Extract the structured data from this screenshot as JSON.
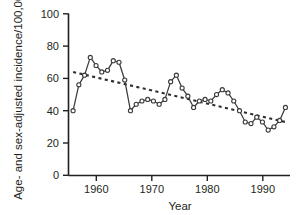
{
  "chart_data": {
    "type": "line",
    "title": "",
    "xlabel": "Year",
    "ylabel": "Age- and sex-adjusted incidence/100,000",
    "xlim": [
      1955.2,
      1993.8
    ],
    "ylim": [
      0,
      100
    ],
    "xticks": [
      1960,
      1970,
      1980,
      1990
    ],
    "xtick_labels": [
      "1960",
      "1970",
      "1980",
      "1990"
    ],
    "yticks": [
      0,
      20,
      40,
      60,
      80,
      100
    ],
    "ytick_labels": [
      "0",
      "20",
      "40",
      "60",
      "80",
      "100"
    ],
    "grid": false,
    "legend": "none",
    "series": [
      {
        "name": "Age- and sex-adjusted incidence",
        "style": "solid-line-with-open-circle-markers",
        "marker": "open-circle",
        "color": "#3b3b3b",
        "x": [
          1956,
          1957,
          1958,
          1959,
          1960,
          1961,
          1962,
          1963,
          1964,
          1965,
          1966,
          1967,
          1968,
          1969,
          1970,
          1971,
          1972,
          1973,
          1974,
          1975,
          1976,
          1977,
          1978,
          1979,
          1980,
          1981,
          1982,
          1983,
          1984,
          1985,
          1986,
          1987,
          1988,
          1989,
          1990,
          1991,
          1992,
          1993
        ],
        "values": [
          40,
          56,
          62,
          73,
          68,
          64,
          65,
          71,
          70,
          59,
          40,
          44,
          46,
          47,
          46,
          44,
          47,
          58,
          62,
          54,
          49,
          42,
          46,
          47,
          46,
          50,
          53,
          51,
          46,
          40,
          33,
          32,
          36,
          33,
          28,
          30,
          34,
          42
        ]
      },
      {
        "name": "Linear trend",
        "style": "dotted-line",
        "marker": "none",
        "color": "#2f2f2f",
        "x": [
          1956,
          1993
        ],
        "values": [
          64,
          33
        ]
      }
    ]
  }
}
